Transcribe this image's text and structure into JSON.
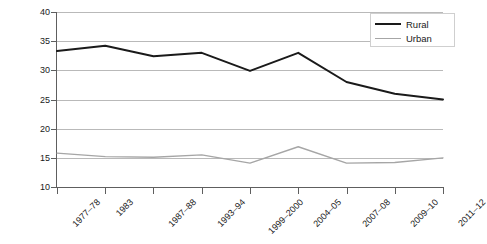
{
  "chart_data": {
    "type": "line",
    "title": "",
    "subtitle": "",
    "xlabel": "",
    "ylabel": "",
    "categories": [
      "1977–78",
      "1983",
      "1987–88",
      "1993–94",
      "1999–2000",
      "2004–05",
      "2007–08",
      "2009–10",
      "2011–12"
    ],
    "ylim": [
      10,
      40
    ],
    "yticks": [
      10,
      15,
      20,
      25,
      30,
      35,
      40
    ],
    "ytick_labels": [
      "10",
      "15",
      "20",
      "25",
      "30",
      "35",
      "40"
    ],
    "grid": true,
    "legend_position": "top-right",
    "series": [
      {
        "name": "Rural",
        "color": "#1a1a1a",
        "values": [
          33.3,
          34.2,
          32.4,
          33.0,
          29.9,
          33.0,
          28.0,
          26.0,
          25.0
        ]
      },
      {
        "name": "Urban",
        "color": "#a6a6a6",
        "values": [
          15.8,
          15.2,
          15.1,
          15.5,
          14.1,
          16.9,
          14.1,
          14.2,
          15.0
        ]
      }
    ]
  },
  "legend": {
    "items": [
      {
        "label": "Rural"
      },
      {
        "label": "Urban"
      }
    ]
  },
  "colors": {
    "rural": "#1a1a1a",
    "urban": "#a6a6a6",
    "gridline": "#b9b9b9",
    "axis": "#5e5e5e",
    "background": "#ffffff"
  }
}
